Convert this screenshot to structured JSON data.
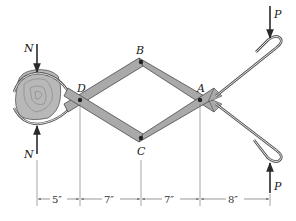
{
  "diagram": {
    "type": "mechanism-free-body",
    "points": {
      "A": {
        "label": "A"
      },
      "B": {
        "label": "B"
      },
      "C": {
        "label": "C"
      },
      "D": {
        "label": "D"
      }
    },
    "forces": {
      "N_top": {
        "label": "N",
        "direction": "down"
      },
      "N_bottom": {
        "label": "N",
        "direction": "up"
      },
      "P_top": {
        "label": "P",
        "direction": "down"
      },
      "P_bottom": {
        "label": "P",
        "direction": "up"
      }
    },
    "dimensions": [
      {
        "label": "5″"
      },
      {
        "label": "7″"
      },
      {
        "label": "7″"
      },
      {
        "label": "8″"
      }
    ],
    "colors": {
      "link_fill": "#a9a9a9",
      "link_stroke": "#4a4a4a",
      "line": "#2a2a2a",
      "object_fill": "#b8b8b8"
    }
  }
}
